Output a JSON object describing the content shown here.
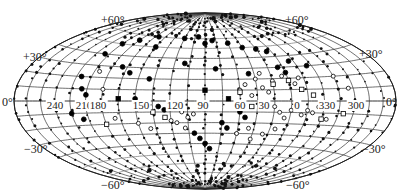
{
  "chart_data": {
    "type": "scatter",
    "title": "",
    "projection": "Hammer-Aitoff (galactic coordinates)",
    "xlabel": "Galactic longitude",
    "ylabel": "Galactic latitude",
    "center_longitude": 90,
    "longitude_direction": "decreasing to the right",
    "grid": true,
    "graticule": {
      "meridian_step_deg": 15,
      "parallel_step_deg": 10
    },
    "latitude_labels": [
      "+60°",
      "+30°",
      "0°",
      "−30°",
      "−60°"
    ],
    "longitude_labels": [
      "240",
      "210",
      "180",
      "150",
      "120",
      "90",
      "60",
      "30",
      "0",
      "330",
      "300"
    ],
    "legend": [],
    "marker_types": [
      "small filled dot",
      "filled circle",
      "open circle",
      "open square",
      "filled square"
    ],
    "series": [
      {
        "name": "filled circles",
        "marker": "filled-circle",
        "points": [
          [
            200,
            40
          ],
          [
            195,
            50
          ],
          [
            180,
            55
          ],
          [
            160,
            60
          ],
          [
            150,
            50
          ],
          [
            120,
            60
          ],
          [
            100,
            62
          ],
          [
            90,
            55
          ],
          [
            80,
            58
          ],
          [
            60,
            55
          ],
          [
            45,
            50
          ],
          [
            30,
            48
          ],
          [
            20,
            45
          ],
          [
            205,
            20
          ],
          [
            200,
            10
          ],
          [
            195,
            5
          ],
          [
            210,
            -10
          ],
          [
            200,
            -15
          ],
          [
            150,
            2
          ],
          [
            130,
            -5
          ],
          [
            125,
            -8
          ],
          [
            100,
            -30
          ],
          [
            95,
            -35
          ],
          [
            90,
            -40
          ],
          [
            85,
            -45
          ],
          [
            75,
            -20
          ],
          [
            70,
            -25
          ],
          [
            60,
            -10
          ],
          [
            55,
            -15
          ],
          [
            170,
            30
          ],
          [
            160,
            25
          ],
          [
            140,
            20
          ],
          [
            110,
            35
          ],
          [
            80,
            30
          ],
          [
            50,
            25
          ],
          [
            20,
            30
          ],
          [
            15,
            25
          ],
          [
            5,
            35
          ],
          [
            350,
            30
          ]
        ]
      },
      {
        "name": "open circles",
        "marker": "open-circle",
        "points": [
          [
            110,
            -10
          ],
          [
            105,
            -15
          ],
          [
            100,
            -12
          ],
          [
            115,
            -20
          ],
          [
            120,
            -18
          ],
          [
            108,
            -25
          ],
          [
            60,
            10
          ],
          [
            55,
            15
          ],
          [
            50,
            5
          ],
          [
            40,
            12
          ],
          [
            35,
            8
          ],
          [
            30,
            -5
          ],
          [
            25,
            -10
          ],
          [
            20,
            -15
          ],
          [
            15,
            -8
          ],
          [
            10,
            -5
          ],
          [
            5,
            -12
          ],
          [
            0,
            -8
          ],
          [
            355,
            -10
          ],
          [
            350,
            -5
          ],
          [
            340,
            -15
          ],
          [
            45,
            20
          ],
          [
            40,
            25
          ],
          [
            30,
            18
          ],
          [
            20,
            22
          ],
          [
            10,
            15
          ],
          [
            5,
            20
          ],
          [
            190,
            25
          ],
          [
            180,
            10
          ],
          [
            170,
            -15
          ],
          [
            150,
            -20
          ],
          [
            140,
            -25
          ],
          [
            60,
            -30
          ],
          [
            50,
            -25
          ],
          [
            45,
            -35
          ],
          [
            35,
            -30
          ],
          [
            25,
            -25
          ],
          [
            330,
            20
          ],
          [
            320,
            10
          ]
        ]
      },
      {
        "name": "open squares",
        "marker": "open-square",
        "points": [
          [
            135,
            -10
          ],
          [
            125,
            -15
          ],
          [
            60,
            8
          ],
          [
            30,
            15
          ],
          [
            15,
            18
          ],
          [
            5,
            10
          ],
          [
            355,
            5
          ],
          [
            345,
            -15
          ],
          [
            325,
            -10
          ],
          [
            180,
            -20
          ],
          [
            50,
            -5
          ],
          [
            40,
            -2
          ]
        ]
      },
      {
        "name": "filled squares",
        "marker": "filled-square",
        "points": [
          [
            165,
            2
          ],
          [
            70,
            2
          ],
          [
            90,
            10
          ]
        ]
      },
      {
        "name": "small dots",
        "marker": "dot",
        "density": "dense along meridians, concentrated toward poles"
      }
    ]
  }
}
